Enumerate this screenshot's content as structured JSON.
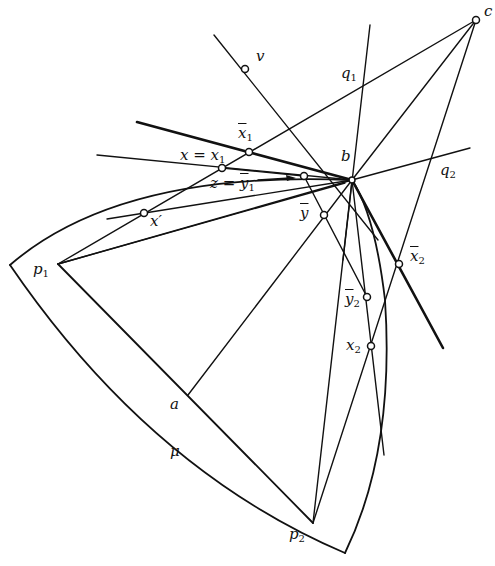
{
  "diagram": {
    "type": "geometric-construction",
    "points": {
      "c": {
        "label": "c",
        "x": 476,
        "y": 20
      },
      "v": {
        "label": "v",
        "x": 245,
        "y": 69
      },
      "b": {
        "label": "b",
        "x": 352,
        "y": 180
      },
      "x_bar_1": {
        "label": "x",
        "sub": "1",
        "bar": true,
        "x": 249,
        "y": 152
      },
      "x_eq_x1": {
        "label": "x = x",
        "sub": "1",
        "x": 222,
        "y": 168
      },
      "z_eq_y1": {
        "label": "z = y",
        "sub": "1",
        "bar": true,
        "x": 304,
        "y": 176
      },
      "x_prime": {
        "label": "x′",
        "x": 144,
        "y": 213
      },
      "y_bar": {
        "label": "ȳ",
        "x": 324,
        "y": 215
      },
      "x_bar_2": {
        "label": "x",
        "sub": "2",
        "bar": true,
        "x": 399,
        "y": 264
      },
      "y_bar_2": {
        "label": "y",
        "sub": "2",
        "bar": true,
        "x": 367,
        "y": 297
      },
      "x_2": {
        "label": "x",
        "sub": "2",
        "x": 371,
        "y": 346
      },
      "p_1": {
        "label": "p",
        "sub": "1",
        "x": 58,
        "y": 264
      },
      "p_2": {
        "label": "p",
        "sub": "2",
        "x": 313,
        "y": 523
      },
      "a": {
        "label": "a",
        "x": 188,
        "y": 395
      }
    },
    "labels": {
      "c": "c",
      "v": "v",
      "q1_base": "q",
      "q1_sub": "1",
      "q2_base": "q",
      "q2_sub": "2",
      "b": "b",
      "xbar1_base": "x",
      "xbar1_sub": "1",
      "x_eq_x1_text": "x = x",
      "x_eq_x1_sub": "1",
      "z_eq_text": "z = ",
      "z_eq_ybar": "y",
      "z_eq_sub": "1",
      "x_prime": "x′",
      "y_bar": "y",
      "xbar2_base": "x",
      "xbar2_sub": "2",
      "ybar2_base": "y",
      "ybar2_sub": "2",
      "x2_base": "x",
      "x2_sub": "2",
      "p1_base": "p",
      "p1_sub": "1",
      "p2_base": "p",
      "p2_sub": "2",
      "a": "a",
      "mu": "μ"
    },
    "arrow": {
      "from": "z_eq_y1_label",
      "to": "z_eq_y1_point"
    }
  }
}
